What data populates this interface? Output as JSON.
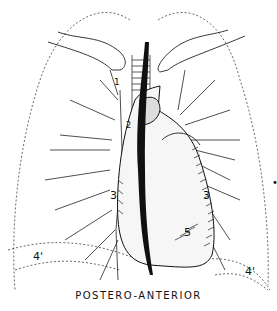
{
  "diagram": {
    "caption": "POSTERO-ANTERIOR",
    "labels": {
      "l1": "1",
      "l2": "2",
      "l3_left": "3",
      "l3_right": "3",
      "l5": "5",
      "l4_left": "4'",
      "l4_right": "4'"
    },
    "colors": {
      "ink": "#111111",
      "background": "#ffffff"
    }
  }
}
